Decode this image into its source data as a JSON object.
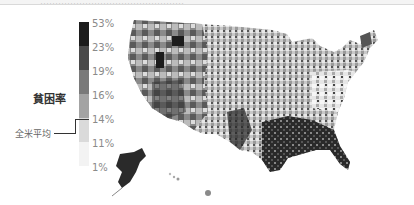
{
  "header": {
    "caption": "…………………………………………"
  },
  "legend": {
    "title": "貧困率",
    "average_label": "全米平均",
    "ticks": [
      "53%",
      "23%",
      "19%",
      "16%",
      "14%",
      "11%",
      "1%"
    ],
    "bands": [
      {
        "range": "23%–53%",
        "color": "#1c1c1c"
      },
      {
        "range": "19%–23%",
        "color": "#4a4a4a"
      },
      {
        "range": "16%–19%",
        "color": "#7a7a7a"
      },
      {
        "range": "14%–16%",
        "color": "#a3a3a3"
      },
      {
        "range": "11%–14%",
        "color": "#dadada"
      },
      {
        "range": "1%–11%",
        "color": "#f3f3f3"
      }
    ],
    "average_marker_at": "14%"
  },
  "map": {
    "subject": "United States county-level poverty rate choropleth",
    "regions_shown": [
      "Contiguous United States",
      "Alaska",
      "Hawaii"
    ]
  }
}
